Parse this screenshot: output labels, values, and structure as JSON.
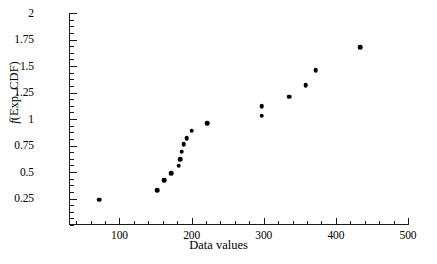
{
  "chart_data": {
    "type": "scatter",
    "title": "",
    "xlabel": "Data values",
    "ylabel": "f(Exp. CDF)",
    "ylabel_parts": {
      "italic": "f",
      "rest": "(Exp. CDF)"
    },
    "xlim": [
      30,
      500
    ],
    "ylim": [
      0.0,
      2.0
    ],
    "grid": false,
    "legend": null,
    "xticks": [
      100,
      200,
      300,
      400,
      500
    ],
    "xtick_labels": [
      "100",
      "200",
      "300",
      "400",
      "500"
    ],
    "xticks_minor_step": 20,
    "yticks": [
      0.25,
      0.5,
      0.75,
      1,
      1.25,
      1.5,
      1.75,
      2
    ],
    "ytick_labels": [
      "0.25",
      "0.5",
      "0.75",
      "1",
      "1.25",
      "1.5",
      "1.75",
      "2"
    ],
    "yticks_minor_step": 0.0625,
    "marker": "filled-circle",
    "marker_color": "#000000",
    "x": [
      72,
      152,
      162,
      172,
      182,
      184,
      186,
      189,
      193,
      200,
      222,
      297,
      297,
      335,
      358,
      372,
      434
    ],
    "y": [
      0.24,
      0.33,
      0.42,
      0.49,
      0.56,
      0.62,
      0.69,
      0.76,
      0.82,
      0.89,
      0.96,
      1.03,
      1.12,
      1.21,
      1.32,
      1.46,
      1.68
    ],
    "points": [
      {
        "x": 72,
        "y": 0.24
      },
      {
        "x": 152,
        "y": 0.33
      },
      {
        "x": 162,
        "y": 0.42
      },
      {
        "x": 172,
        "y": 0.49
      },
      {
        "x": 182,
        "y": 0.56
      },
      {
        "x": 184,
        "y": 0.62
      },
      {
        "x": 186,
        "y": 0.69
      },
      {
        "x": 189,
        "y": 0.76
      },
      {
        "x": 193,
        "y": 0.82
      },
      {
        "x": 200,
        "y": 0.89
      },
      {
        "x": 222,
        "y": 0.96
      },
      {
        "x": 297,
        "y": 1.03
      },
      {
        "x": 297,
        "y": 1.12
      },
      {
        "x": 335,
        "y": 1.21
      },
      {
        "x": 358,
        "y": 1.32
      },
      {
        "x": 372,
        "y": 1.46
      },
      {
        "x": 434,
        "y": 1.68
      }
    ]
  }
}
